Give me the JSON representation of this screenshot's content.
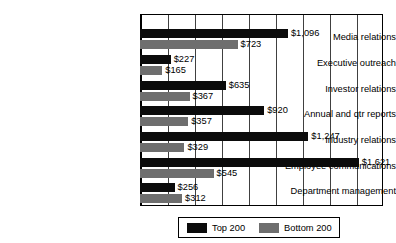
{
  "chart_data": {
    "type": "bar",
    "orientation": "horizontal",
    "title": "",
    "xlabel": "",
    "ylabel": "",
    "grid": true,
    "xlim": [
      0,
      1800
    ],
    "xtick_interval": 200,
    "value_prefix": "$",
    "legend_position": "bottom-center",
    "categories": [
      "Media relations",
      "Executive outreach",
      "Investor relations",
      "Annual and qtr reports",
      "Industry relations",
      "Employee communications",
      "Department management"
    ],
    "series": [
      {
        "name": "Top 200",
        "color": "#0b0b0b",
        "values": [
          1096,
          227,
          635,
          920,
          1247,
          1621,
          256
        ],
        "labels": [
          "$1,096",
          "$227",
          "$635",
          "$920",
          "$1,247",
          "$1,621",
          "$256"
        ]
      },
      {
        "name": "Bottom 200",
        "color": "#6e6e6e",
        "values": [
          723,
          165,
          367,
          357,
          329,
          545,
          312
        ],
        "labels": [
          "$723",
          "$165",
          "$367",
          "$357",
          "$329",
          "$545",
          "$312"
        ]
      }
    ]
  },
  "legend": {
    "items": [
      {
        "label": "Top 200",
        "swatch": "top"
      },
      {
        "label": "Bottom 200",
        "swatch": "bottom"
      }
    ]
  }
}
